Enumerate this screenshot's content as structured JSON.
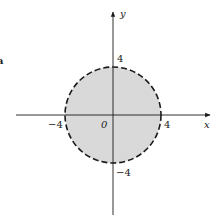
{
  "diagram": {
    "type": "disk-region",
    "axes": {
      "x_label": "x",
      "y_label": "y",
      "origin_label": "0"
    },
    "ticks": {
      "x_neg": "−4",
      "x_pos": "4",
      "y_pos": "4",
      "y_neg": "−4"
    },
    "edge_fragment": "a",
    "colors": {
      "fill": "#d9d9d9",
      "stroke": "#1a1a1a"
    }
  }
}
